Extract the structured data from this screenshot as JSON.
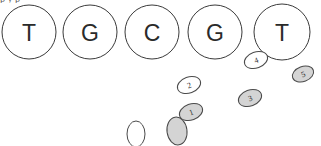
{
  "diagram": {
    "background_color": "#ffffff",
    "outline_color": "#3a3a3a",
    "fill_gray": "#d4d4d4",
    "fill_white": "#ffffff",
    "clipped_top_text": "p  y                     p",
    "nucleotide_circles": [
      {
        "label": "T",
        "cx": 29,
        "cy": 32,
        "r": 27
      },
      {
        "label": "G",
        "cx": 90,
        "cy": 32,
        "r": 27
      },
      {
        "label": "C",
        "cx": 152,
        "cy": 32,
        "r": 27
      },
      {
        "label": "G",
        "cx": 215,
        "cy": 32,
        "r": 27
      },
      {
        "label": "T",
        "cx": 282,
        "cy": 32,
        "r": 28
      }
    ],
    "numbered_ellipses": [
      {
        "label": "4",
        "cx": 256,
        "cy": 60,
        "rx": 12,
        "ry": 8,
        "rotate": -20,
        "fill": "white"
      },
      {
        "label": "5",
        "cx": 303,
        "cy": 74,
        "rx": 11,
        "ry": 7.5,
        "rotate": -20,
        "fill": "gray"
      },
      {
        "label": "2",
        "cx": 189,
        "cy": 85,
        "rx": 12,
        "ry": 8,
        "rotate": -20,
        "fill": "white"
      },
      {
        "label": "3",
        "cx": 250,
        "cy": 98,
        "rx": 12,
        "ry": 8,
        "rotate": -20,
        "fill": "gray"
      },
      {
        "label": "1",
        "cx": 191,
        "cy": 112,
        "rx": 12,
        "ry": 8,
        "rotate": -20,
        "fill": "gray"
      }
    ],
    "unlabeled_ellipses": [
      {
        "name": "bottom-left-ellipse",
        "cx": 136,
        "cy": 134,
        "rx": 9,
        "ry": 13,
        "rotate": 0,
        "fill": "white"
      },
      {
        "name": "bottom-right-ellipse",
        "cx": 177,
        "cy": 131,
        "rx": 10,
        "ry": 14,
        "rotate": -8,
        "fill": "gray"
      }
    ]
  }
}
